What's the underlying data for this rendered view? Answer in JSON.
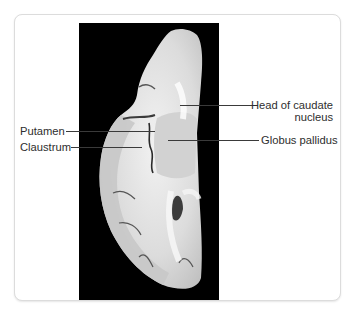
{
  "figure": {
    "image_description": "Coronal section of brain hemisphere on black background",
    "labels": {
      "head_of_caudate_line1": "Head of caudate",
      "head_of_caudate_line2": "nucleus",
      "putamen": "Putamen",
      "claustrum": "Claustrum",
      "globus_pallidus": "Globus pallidus"
    },
    "colors": {
      "background": "#ffffff",
      "frame_border": "#dcdcdc",
      "photo_background": "#000000",
      "label_text": "#2e2e2e",
      "leader_line": "#3a3a3a"
    }
  }
}
